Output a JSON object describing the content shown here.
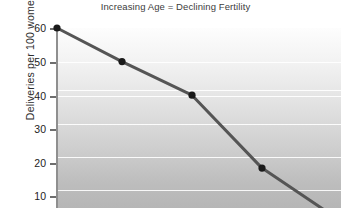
{
  "chart_data": {
    "type": "line",
    "title": "Increasing Age = Declining Fertility",
    "xlabel": "",
    "ylabel": "Deliveries per 100 women (%)",
    "ylim": [
      0,
      60
    ],
    "yticks": [
      10,
      20,
      30,
      40,
      50,
      60
    ],
    "ytick_labels": [
      "10",
      "20",
      "30",
      "40",
      "50",
      "60"
    ],
    "grid": true,
    "legend": "none",
    "note": "x-axis is cropped out of the screenshot; points are positioned by pixel location",
    "series": [
      {
        "name": "Deliveries per 100 women",
        "color": "#555555",
        "marker_color": "#1a1a1a",
        "values": [
          60,
          50,
          40,
          18.3
        ],
        "x_pixels": [
          57,
          122,
          192,
          262
        ],
        "y_values_extended": [
          60,
          50,
          40,
          18.3,
          2.5
        ],
        "x_pixels_extended": [
          57,
          122,
          192,
          262,
          341
        ]
      }
    ]
  },
  "labels": {
    "title": "Increasing Age = Declining Fertility",
    "ylabel": "Deliveries per 100 women (%)",
    "y_ticks": [
      {
        "value": 60,
        "text": "60",
        "y": 28
      },
      {
        "value": 50,
        "text": "50",
        "y": 62
      },
      {
        "value": 40,
        "text": "40",
        "y": 96
      },
      {
        "value": 30,
        "text": "30",
        "y": 129
      },
      {
        "value": 20,
        "text": "20",
        "y": 163
      },
      {
        "value": 10,
        "text": "10",
        "y": 196
      }
    ]
  },
  "colors": {
    "line": "#555555",
    "marker": "#1a1a1a",
    "gridline": "#ffffff",
    "axis": "#8f8f8f",
    "title_text": "#3c3c3c",
    "tick_text": "#222222",
    "plot_bg_top": "#fdfdfd",
    "plot_bg_bottom": "#b6b6b6",
    "page_bg": "#ffffff"
  }
}
